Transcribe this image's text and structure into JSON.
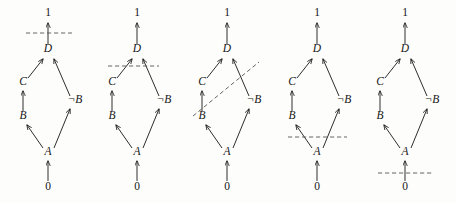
{
  "figure": {
    "title": "",
    "background_color": "#fdfdfc",
    "ink_color": "#161616",
    "dash_color": "#555555",
    "width": 456,
    "height": 203,
    "panel_count": 5
  },
  "node_labels": {
    "top": "1",
    "d": "D",
    "c": "C",
    "notb": "¬B",
    "b": "B",
    "a": "A",
    "bottom": "0"
  },
  "edges": [
    {
      "from": "0",
      "to": "A"
    },
    {
      "from": "A",
      "to": "B"
    },
    {
      "from": "A",
      "to": "¬B"
    },
    {
      "from": "B",
      "to": "C"
    },
    {
      "from": "C",
      "to": "D"
    },
    {
      "from": "¬B",
      "to": "D"
    },
    {
      "from": "D",
      "to": "1"
    }
  ],
  "panels": [
    {
      "index": 1,
      "name": "panel-cut-above-d",
      "offset_x": 0,
      "cut": {
        "kind": "horizontal",
        "label": "cut between D and 1",
        "x1": 26,
        "y1": 33,
        "x2": 72,
        "y2": 33,
        "crosses": [
          "D→1"
        ]
      },
      "nodes": [
        {
          "id": "top",
          "label": "1",
          "x": 48,
          "y": 16,
          "style": "plain"
        },
        {
          "id": "d",
          "label": "D",
          "x": 48,
          "y": 52,
          "style": "italic"
        },
        {
          "id": "c",
          "label": "C",
          "x": 23,
          "y": 85,
          "style": "italic"
        },
        {
          "id": "notb",
          "label": "¬B",
          "x": 75,
          "y": 103,
          "style": "italic"
        },
        {
          "id": "b",
          "label": "B",
          "x": 23,
          "y": 119,
          "style": "italic"
        },
        {
          "id": "a",
          "label": "A",
          "x": 48,
          "y": 155,
          "style": "italic"
        },
        {
          "id": "bottom",
          "label": "0",
          "x": 48,
          "y": 190,
          "style": "plain"
        }
      ]
    },
    {
      "index": 2,
      "name": "panel-cut-below-d",
      "offset_x": 89,
      "cut": {
        "kind": "horizontal",
        "label": "cut between C / ¬B and D",
        "x1": 19,
        "y1": 66,
        "x2": 70,
        "y2": 66,
        "crosses": [
          "C→D",
          "¬B→D"
        ]
      },
      "nodes": [
        {
          "id": "top",
          "label": "1",
          "x": 48,
          "y": 16,
          "style": "plain"
        },
        {
          "id": "d",
          "label": "D",
          "x": 48,
          "y": 52,
          "style": "italic"
        },
        {
          "id": "c",
          "label": "C",
          "x": 23,
          "y": 85,
          "style": "italic"
        },
        {
          "id": "notb",
          "label": "¬B",
          "x": 75,
          "y": 103,
          "style": "italic"
        },
        {
          "id": "b",
          "label": "B",
          "x": 23,
          "y": 119,
          "style": "italic"
        },
        {
          "id": "a",
          "label": "A",
          "x": 48,
          "y": 155,
          "style": "italic"
        },
        {
          "id": "bottom",
          "label": "0",
          "x": 48,
          "y": 190,
          "style": "plain"
        }
      ]
    },
    {
      "index": 3,
      "name": "panel-cut-diagonal",
      "offset_x": 179,
      "cut": {
        "kind": "diagonal",
        "label": "slanted cut crossing B→C and ¬B→D",
        "x1": 14,
        "y1": 116,
        "x2": 80,
        "y2": 62,
        "crosses": [
          "B→C",
          "¬B→D"
        ]
      },
      "nodes": [
        {
          "id": "top",
          "label": "1",
          "x": 48,
          "y": 16,
          "style": "plain"
        },
        {
          "id": "d",
          "label": "D",
          "x": 48,
          "y": 52,
          "style": "italic"
        },
        {
          "id": "c",
          "label": "C",
          "x": 23,
          "y": 85,
          "style": "italic"
        },
        {
          "id": "notb",
          "label": "¬B",
          "x": 75,
          "y": 103,
          "style": "italic"
        },
        {
          "id": "b",
          "label": "B",
          "x": 23,
          "y": 119,
          "style": "italic"
        },
        {
          "id": "a",
          "label": "A",
          "x": 48,
          "y": 155,
          "style": "italic"
        },
        {
          "id": "bottom",
          "label": "0",
          "x": 48,
          "y": 190,
          "style": "plain"
        }
      ]
    },
    {
      "index": 4,
      "name": "panel-cut-above-a",
      "offset_x": 269,
      "cut": {
        "kind": "horizontal",
        "label": "cut between A and B / ¬B",
        "x1": 19,
        "y1": 137,
        "x2": 78,
        "y2": 137,
        "crosses": [
          "A→B",
          "A→¬B"
        ]
      },
      "nodes": [
        {
          "id": "top",
          "label": "1",
          "x": 48,
          "y": 16,
          "style": "plain"
        },
        {
          "id": "d",
          "label": "D",
          "x": 48,
          "y": 52,
          "style": "italic"
        },
        {
          "id": "c",
          "label": "C",
          "x": 23,
          "y": 85,
          "style": "italic"
        },
        {
          "id": "notb",
          "label": "¬B",
          "x": 75,
          "y": 103,
          "style": "italic"
        },
        {
          "id": "b",
          "label": "B",
          "x": 23,
          "y": 119,
          "style": "italic"
        },
        {
          "id": "a",
          "label": "A",
          "x": 48,
          "y": 155,
          "style": "italic"
        },
        {
          "id": "bottom",
          "label": "0",
          "x": 48,
          "y": 190,
          "style": "plain"
        }
      ]
    },
    {
      "index": 5,
      "name": "panel-cut-above-zero",
      "offset_x": 357,
      "cut": {
        "kind": "horizontal",
        "label": "cut between 0 and A",
        "x1": 21,
        "y1": 173,
        "x2": 76,
        "y2": 173,
        "crosses": [
          "0→A"
        ]
      },
      "nodes": [
        {
          "id": "top",
          "label": "1",
          "x": 48,
          "y": 16,
          "style": "plain"
        },
        {
          "id": "d",
          "label": "D",
          "x": 48,
          "y": 52,
          "style": "italic"
        },
        {
          "id": "c",
          "label": "C",
          "x": 23,
          "y": 85,
          "style": "italic"
        },
        {
          "id": "notb",
          "label": "¬B",
          "x": 75,
          "y": 103,
          "style": "italic"
        },
        {
          "id": "b",
          "label": "B",
          "x": 23,
          "y": 119,
          "style": "italic"
        },
        {
          "id": "a",
          "label": "A",
          "x": 48,
          "y": 155,
          "style": "italic"
        },
        {
          "id": "bottom",
          "label": "0",
          "x": 48,
          "y": 190,
          "style": "plain"
        }
      ]
    }
  ],
  "edge_geometry": [
    {
      "name": "zero-to-a",
      "from": "0",
      "to": "A",
      "x1": 48,
      "y1": 181,
      "x2": 48,
      "y2": 161
    },
    {
      "name": "a-to-b",
      "from": "A",
      "to": "B",
      "x1": 43,
      "y1": 148,
      "x2": 27,
      "y2": 125
    },
    {
      "name": "a-to-notb",
      "from": "A",
      "to": "¬B",
      "x1": 54,
      "y1": 148,
      "x2": 70,
      "y2": 109
    },
    {
      "name": "b-to-c",
      "from": "B",
      "to": "C",
      "x1": 23,
      "y1": 111,
      "x2": 23,
      "y2": 91
    },
    {
      "name": "c-to-d",
      "from": "C",
      "to": "D",
      "x1": 28,
      "y1": 78,
      "x2": 43,
      "y2": 59
    },
    {
      "name": "notb-to-d",
      "from": "¬B",
      "to": "D",
      "x1": 70,
      "y1": 96,
      "x2": 54,
      "y2": 59
    },
    {
      "name": "d-to-one",
      "from": "D",
      "to": "1",
      "x1": 48,
      "y1": 44,
      "x2": 48,
      "y2": 23
    }
  ]
}
